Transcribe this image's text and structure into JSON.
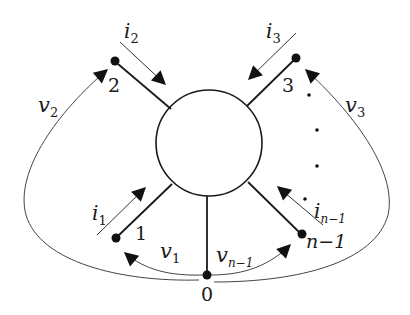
{
  "diagram": {
    "type": "n-terminal network",
    "center_element": "multiterminal-circuit",
    "reference_node": {
      "id": "0",
      "label": "0"
    },
    "terminals": [
      {
        "id": "1",
        "label": "1",
        "current": "i",
        "current_sub": "1",
        "voltage": "v",
        "voltage_sub": "1"
      },
      {
        "id": "2",
        "label": "2",
        "current": "i",
        "current_sub": "2",
        "voltage": "v",
        "voltage_sub": "2"
      },
      {
        "id": "3",
        "label": "3",
        "current": "i",
        "current_sub": "3",
        "voltage": "v",
        "voltage_sub": "3"
      },
      {
        "id": "n-1",
        "label": "n−1",
        "current": "i",
        "current_sub": "n−1",
        "voltage": "v",
        "voltage_sub": "n−1"
      }
    ],
    "ellipsis": "· · ·",
    "colors": {
      "stroke": "#1a1a1a",
      "background": "#ffffff"
    }
  }
}
